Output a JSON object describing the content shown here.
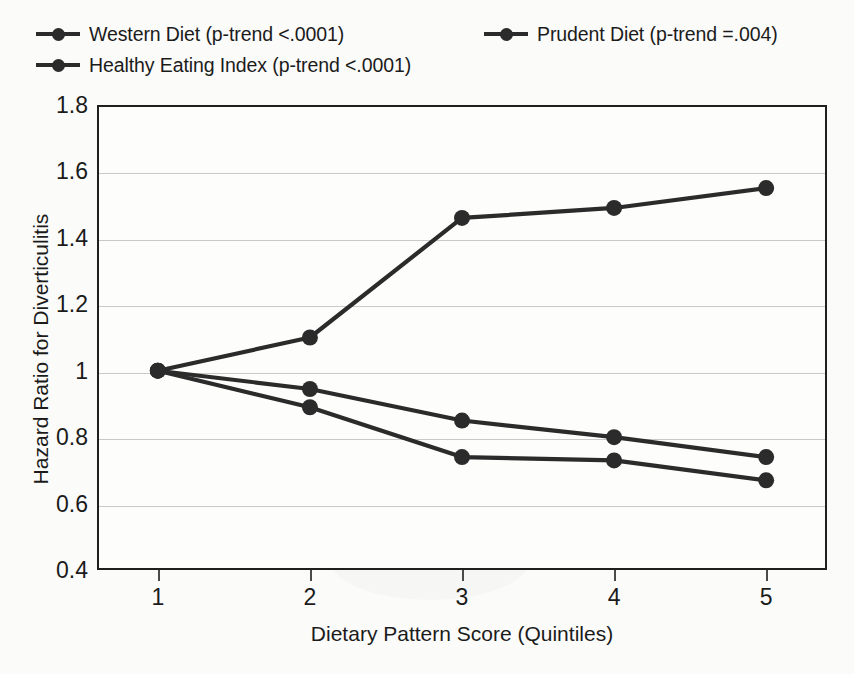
{
  "chart_data": {
    "type": "line",
    "title": "",
    "xlabel": "Dietary Pattern Score (Quintiles)",
    "ylabel": "Hazard Ratio for Diverticulitis",
    "x": [
      1,
      2,
      3,
      4,
      5
    ],
    "categories": [
      "1",
      "2",
      "3",
      "4",
      "5"
    ],
    "xlim": [
      0.6,
      5.4
    ],
    "ylim": [
      0.4,
      1.8
    ],
    "yticks": [
      0.4,
      0.6,
      0.8,
      1,
      1.2,
      1.4,
      1.6,
      1.8
    ],
    "ytick_labels": [
      "0.4",
      "0.6",
      "0.8",
      "1",
      "1.2",
      "1.4",
      "1.6",
      "1.8"
    ],
    "xticks": [
      1,
      2,
      3,
      4,
      5
    ],
    "xtick_labels": [
      "1",
      "2",
      "3",
      "4",
      "5"
    ],
    "grid": "horizontal",
    "legend_position": "above-plot",
    "marker": "circle",
    "series": [
      {
        "name": "Western Diet (p-trend <.0001)",
        "short_name": "Western Diet",
        "p_trend": "<.0001",
        "color": "#2b2b2b",
        "values": [
          1.0,
          1.1,
          1.46,
          1.49,
          1.55
        ]
      },
      {
        "name": "Prudent Diet (p-trend =.004)",
        "short_name": "Prudent Diet",
        "p_trend": "=.004",
        "color": "#2b2b2b",
        "values": [
          1.0,
          0.945,
          0.85,
          0.8,
          0.74
        ]
      },
      {
        "name": "Healthy Eating Index (p-trend <.0001)",
        "short_name": "Healthy Eating Index",
        "p_trend": "<.0001",
        "color": "#2b2b2b",
        "values": [
          1.0,
          0.89,
          0.74,
          0.73,
          0.67
        ]
      }
    ]
  },
  "legend": {
    "items": [
      {
        "label": "Western Diet (p-trend <.0001)"
      },
      {
        "label": "Healthy Eating Index (p-trend <.0001)"
      },
      {
        "label": "Prudent Diet (p-trend =.004)"
      }
    ]
  },
  "axes": {
    "y_title": "Hazard Ratio for Diverticulitis",
    "x_title": "Dietary Pattern Score (Quintiles)"
  },
  "colors": {
    "line": "#2b2b2b",
    "grid": "#c9c9c9",
    "frame": "#1f1f1f",
    "background": "#fbfbfa",
    "text": "#1b1b1b"
  }
}
